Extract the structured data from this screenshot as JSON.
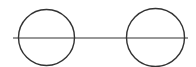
{
  "diagram": {
    "stroke_color": "#333333",
    "background": "#ffffff",
    "line": {
      "x1": 13,
      "y1": 38,
      "x2": 188,
      "y2": 38
    },
    "circles": [
      {
        "cx": 46.5,
        "cy": 37.5,
        "r": 28
      },
      {
        "cx": 155.5,
        "cy": 37.5,
        "r": 29
      }
    ]
  }
}
